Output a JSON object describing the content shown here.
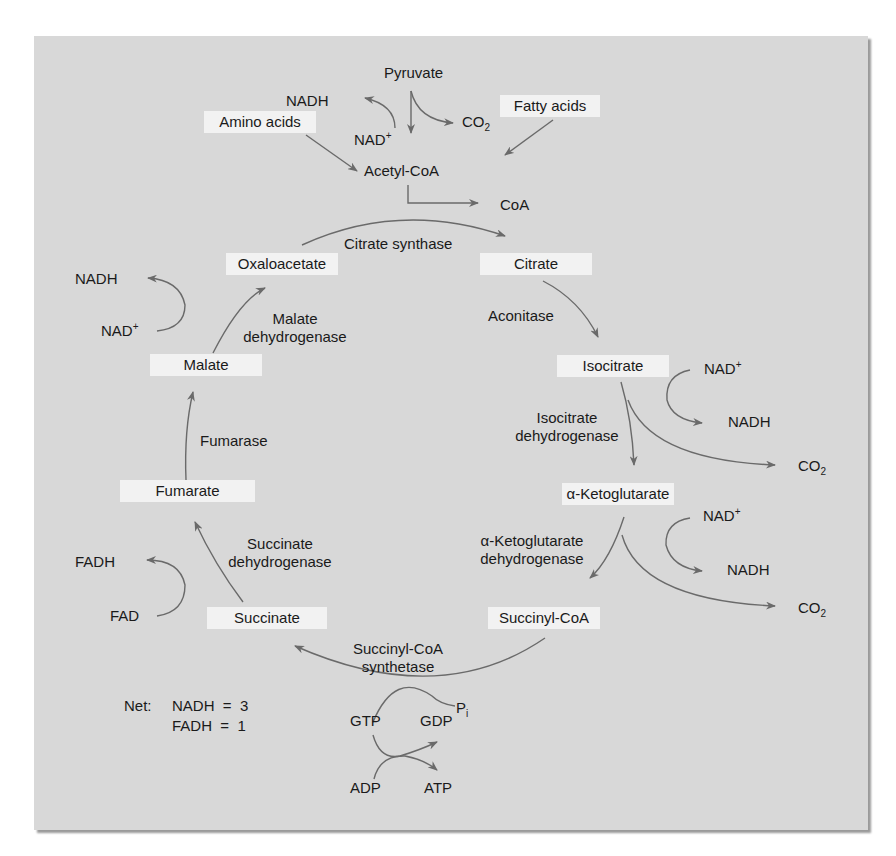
{
  "colors": {
    "panel": "#d8d8d8",
    "label_box": "#f2f2f2",
    "arrow": "#6a6a6a",
    "text": "#1a1a1a"
  },
  "inputs": {
    "pyruvate": "Pyruvate",
    "amino_acids": "Amino acids",
    "fatty_acids": "Fatty acids",
    "acetyl_coa": "Acetyl-CoA",
    "coa": "CoA",
    "nadh_top": "NADH",
    "nad_top": "NAD",
    "co2_top": "CO",
    "co2_sub": "2"
  },
  "intermediates": {
    "oxaloacetate": "Oxaloacetate",
    "citrate": "Citrate",
    "isocitrate": "Isocitrate",
    "alpha_ketoglutarate": "α-Ketoglutarate",
    "succinyl_coa": "Succinyl-CoA",
    "succinate": "Succinate",
    "fumarate": "Fumarate",
    "malate": "Malate"
  },
  "enzymes": {
    "citrate_synthase": "Citrate synthase",
    "aconitase": "Aconitase",
    "isocitrate_dh_1": "Isocitrate",
    "isocitrate_dh_2": "dehydrogenase",
    "akg_dh_1": "α-Ketoglutarate",
    "akg_dh_2": "dehydrogenase",
    "succinyl_syn_1": "Succinyl-CoA",
    "succinyl_syn_2": "synthetase",
    "succinate_dh_1": "Succinate",
    "succinate_dh_2": "dehydrogenase",
    "fumarase": "Fumarase",
    "malate_dh_1": "Malate",
    "malate_dh_2": "dehydrogenase"
  },
  "cofactors": {
    "nad": "NAD",
    "plus": "+",
    "nadh": "NADH",
    "co2": "CO",
    "co2_sub": "2",
    "fad": "FAD",
    "fadh": "FADH",
    "gtp": "GTP",
    "gdp": "GDP",
    "pi": "P",
    "pi_sub": "i",
    "adp": "ADP",
    "atp": "ATP"
  },
  "net": {
    "label": "Net:",
    "nadh_line": "NADH  =  3",
    "fadh_line": "FADH  =  1"
  }
}
